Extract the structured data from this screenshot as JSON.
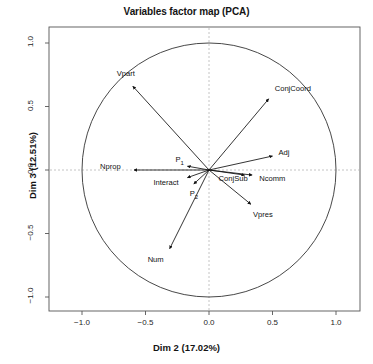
{
  "chart_data": {
    "type": "scatter",
    "title": "Variables factor map (PCA)",
    "xlabel": "Dim 2 (17.02%)",
    "ylabel": "Dim 3 (12.51%)",
    "xlim": [
      -1.15,
      1.15
    ],
    "ylim": [
      -1.15,
      1.15
    ],
    "xticks": [
      "-1.0",
      "-0.5",
      "0.0",
      "0.5",
      "1.0"
    ],
    "xtick_values": [
      -1.0,
      -0.5,
      0.0,
      0.5,
      1.0
    ],
    "yticks": [
      "1.0",
      "0.5",
      "0.0",
      "-0.5",
      "-1.0"
    ],
    "ytick_values": [
      1.0,
      0.5,
      0.0,
      -0.5,
      -1.0
    ],
    "grid": false,
    "legend": "none",
    "correlation_circle_radius": 1.0,
    "annotations": [
      "unit correlation circle drawn at radius 1.0",
      "dashed reference lines at x = 0 and y = 0",
      "each variable drawn as an arrow from the origin"
    ],
    "vectors": [
      {
        "name": "Vpart",
        "label": "Vpart",
        "x": -0.6,
        "y": 0.66,
        "label_dx": -16,
        "label_dy": -12
      },
      {
        "name": "ConjCoord",
        "label": "ConjCoord",
        "x": 0.47,
        "y": 0.56,
        "label_dx": 6,
        "label_dy": -10
      },
      {
        "name": "Adj",
        "label": "Adj",
        "x": 0.5,
        "y": 0.11,
        "label_dx": 6,
        "label_dy": -3
      },
      {
        "name": "Nprop",
        "label": "Nprop",
        "x": -0.59,
        "y": 0.0,
        "label_dx": -34,
        "label_dy": -3
      },
      {
        "name": "Ncomm",
        "label": "Ncomm",
        "x": 0.34,
        "y": -0.04,
        "label_dx": 7,
        "label_dy": 4
      },
      {
        "name": "ConjSub",
        "label": "ConjSub",
        "x": 0.28,
        "y": -0.04,
        "label_dx": -26,
        "label_dy": 4
      },
      {
        "name": "P1",
        "label": "P",
        "sub": "1",
        "x": -0.17,
        "y": 0.03,
        "label_dx": -12,
        "label_dy": -6
      },
      {
        "name": "Interact",
        "label": "Interact",
        "x": -0.17,
        "y": -0.06,
        "label_dx": -34,
        "label_dy": 5
      },
      {
        "name": "P2",
        "label": "P",
        "sub": "2",
        "x": -0.12,
        "y": -0.11,
        "label_dx": -4,
        "label_dy": 10
      },
      {
        "name": "Vpres",
        "label": "Vpres",
        "x": 0.33,
        "y": -0.27,
        "label_dx": 2,
        "label_dy": 11
      },
      {
        "name": "Num",
        "label": "Num",
        "x": -0.31,
        "y": -0.62,
        "label_dx": -22,
        "label_dy": 11
      }
    ]
  },
  "style": {
    "arrow_color": "#111111",
    "circle_color": "#333333",
    "axis_color": "#555555",
    "dash_color": "#b5b5b5",
    "background": "#ffffff"
  }
}
